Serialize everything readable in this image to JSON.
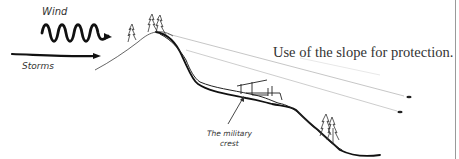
{
  "diagram": {
    "caption": "Use of the slope for protection.",
    "labels": {
      "wind": "Wind",
      "storms": "Storms",
      "military_crest_line1": "The military",
      "military_crest_line2": "crest"
    },
    "colors": {
      "ink": "#1a1a1a",
      "sightline": "#b0b0b0",
      "border": "#9a9a9a",
      "background": "#ffffff"
    }
  }
}
